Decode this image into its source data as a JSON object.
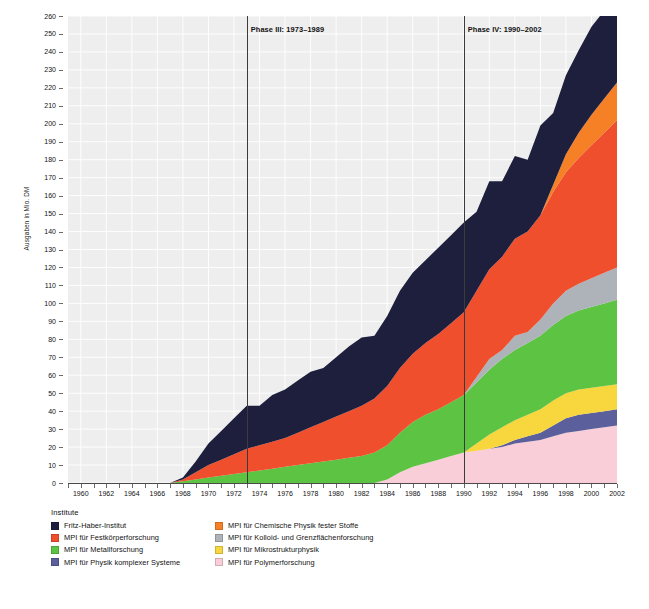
{
  "chart_data": {
    "type": "area",
    "title": "",
    "xlabel": "",
    "ylabel": "Ausgaben in Mio. DM",
    "ylim": [
      0,
      260
    ],
    "ytick_step": 10,
    "xlim": [
      1959,
      2002
    ],
    "grid": true,
    "stacked": true,
    "legend_position": "bottom",
    "legend_title": "Institute",
    "x": [
      1959,
      1960,
      1961,
      1962,
      1963,
      1964,
      1965,
      1966,
      1967,
      1968,
      1969,
      1970,
      1971,
      1972,
      1973,
      1974,
      1975,
      1976,
      1977,
      1978,
      1979,
      1980,
      1981,
      1982,
      1983,
      1984,
      1985,
      1986,
      1987,
      1988,
      1989,
      1990,
      1991,
      1992,
      1993,
      1994,
      1995,
      1996,
      1997,
      1998,
      1999,
      2000,
      2001,
      2002
    ],
    "xtick_labels": [
      "1960",
      "1962",
      "1964",
      "1966",
      "1968",
      "1970",
      "1972",
      "1974",
      "1976",
      "1978",
      "1980",
      "1982",
      "1984",
      "1986",
      "1988",
      "1990",
      "1992",
      "1994",
      "1996",
      "1998",
      "2000",
      "2002"
    ],
    "series": [
      {
        "name": "MPI für Polymerforschung",
        "color": "#f9ced9",
        "values": [
          0,
          0,
          0,
          0,
          0,
          0,
          0,
          0,
          0,
          0,
          0,
          0,
          0,
          0,
          0,
          0,
          0,
          0,
          0,
          0,
          0,
          0,
          0,
          0,
          0,
          2,
          6,
          9,
          11,
          13,
          15,
          17,
          18,
          19,
          20,
          22,
          23,
          24,
          26,
          28,
          29,
          30,
          31,
          32
        ]
      },
      {
        "name": "MPI für Physik komplexer Systeme",
        "color": "#5b5f9c",
        "values": [
          0,
          0,
          0,
          0,
          0,
          0,
          0,
          0,
          0,
          0,
          0,
          0,
          0,
          0,
          0,
          0,
          0,
          0,
          0,
          0,
          0,
          0,
          0,
          0,
          0,
          0,
          0,
          0,
          0,
          0,
          0,
          0,
          0,
          0,
          1,
          2,
          3,
          4,
          6,
          8,
          9,
          9,
          9,
          9
        ]
      },
      {
        "name": "MPI für Mikrostrukturphysik",
        "color": "#f7d63e",
        "values": [
          0,
          0,
          0,
          0,
          0,
          0,
          0,
          0,
          0,
          0,
          0,
          0,
          0,
          0,
          0,
          0,
          0,
          0,
          0,
          0,
          0,
          0,
          0,
          0,
          0,
          0,
          0,
          0,
          0,
          0,
          0,
          0,
          4,
          8,
          10,
          11,
          12,
          13,
          14,
          14,
          14,
          14,
          14,
          14
        ]
      },
      {
        "name": "MPI für Metallforschung",
        "color": "#5cc442",
        "values": [
          0,
          0,
          0,
          0,
          0,
          0,
          0,
          0,
          0,
          1,
          2,
          3,
          4,
          5,
          6,
          7,
          8,
          9,
          10,
          11,
          12,
          13,
          14,
          15,
          17,
          19,
          22,
          25,
          27,
          28,
          30,
          32,
          34,
          36,
          38,
          39,
          40,
          41,
          42,
          43,
          44,
          45,
          46,
          47
        ]
      },
      {
        "name": "MPI für Kolloid- und Grenzflächenforschung",
        "color": "#adb3b8",
        "values": [
          0,
          0,
          0,
          0,
          0,
          0,
          0,
          0,
          0,
          0,
          0,
          0,
          0,
          0,
          0,
          0,
          0,
          0,
          0,
          0,
          0,
          0,
          0,
          0,
          0,
          0,
          0,
          0,
          0,
          0,
          0,
          0,
          3,
          6,
          5,
          8,
          6,
          9,
          12,
          14,
          15,
          16,
          17,
          18
        ]
      },
      {
        "name": "MPI für Festkörperforschung",
        "color": "#f04f2e",
        "values": [
          0,
          0,
          0,
          0,
          0,
          0,
          0,
          0,
          0,
          1,
          4,
          7,
          9,
          11,
          13,
          14,
          15,
          16,
          18,
          20,
          22,
          24,
          26,
          28,
          30,
          33,
          36,
          38,
          40,
          42,
          44,
          46,
          48,
          50,
          52,
          54,
          56,
          58,
          62,
          66,
          70,
          74,
          78,
          82
        ]
      },
      {
        "name": "MPI für Chemische Physik fester Stoffe",
        "color": "#f68026",
        "values": [
          0,
          0,
          0,
          0,
          0,
          0,
          0,
          0,
          0,
          0,
          0,
          0,
          0,
          0,
          0,
          0,
          0,
          0,
          0,
          0,
          0,
          0,
          0,
          0,
          0,
          0,
          0,
          0,
          0,
          0,
          0,
          0,
          0,
          0,
          0,
          0,
          0,
          0,
          4,
          10,
          14,
          17,
          19,
          21
        ]
      },
      {
        "name": "Fritz-Haber-Institut",
        "color": "#1d1f3d",
        "values": [
          0,
          0,
          0,
          0,
          0,
          0,
          0,
          0,
          0,
          1,
          6,
          12,
          16,
          20,
          24,
          22,
          26,
          27,
          29,
          31,
          30,
          33,
          36,
          38,
          35,
          39,
          43,
          45,
          46,
          48,
          49,
          50,
          44,
          49,
          42,
          46,
          40,
          50,
          40,
          44,
          46,
          49,
          49,
          52
        ]
      }
    ],
    "annotations": [
      {
        "label": "Phase III: 1973–1989",
        "x": 1973
      },
      {
        "label": "Phase IV: 1990–2002",
        "x": 1990
      }
    ]
  },
  "legend": {
    "title": "Institute",
    "column_left": [
      {
        "label": "Fritz-Haber-Institut",
        "color": "#1d1f3d"
      },
      {
        "label": "MPI für Festkörperforschung",
        "color": "#f04f2e"
      },
      {
        "label": "MPI für Metallforschung",
        "color": "#5cc442"
      },
      {
        "label": "MPI für Physik komplexer Systeme",
        "color": "#5b5f9c"
      }
    ],
    "column_right": [
      {
        "label": "MPI für Chemische Physik fester Stoffe",
        "color": "#f68026"
      },
      {
        "label": "MPI für Kolloid- und Grenzflächenforschung",
        "color": "#adb3b8"
      },
      {
        "label": "MPI für Mikrostrukturphysik",
        "color": "#f7d63e"
      },
      {
        "label": "MPI für Polymerforschung",
        "color": "#f9ced9"
      }
    ]
  },
  "axes": {
    "y_title": "Ausgaben in Mio. DM",
    "y_ticks": [
      "0",
      "10",
      "20",
      "30",
      "40",
      "50",
      "60",
      "70",
      "80",
      "90",
      "100",
      "110",
      "120",
      "130",
      "140",
      "150",
      "160",
      "170",
      "180",
      "190",
      "200",
      "210",
      "220",
      "230",
      "240",
      "250",
      "260"
    ]
  }
}
